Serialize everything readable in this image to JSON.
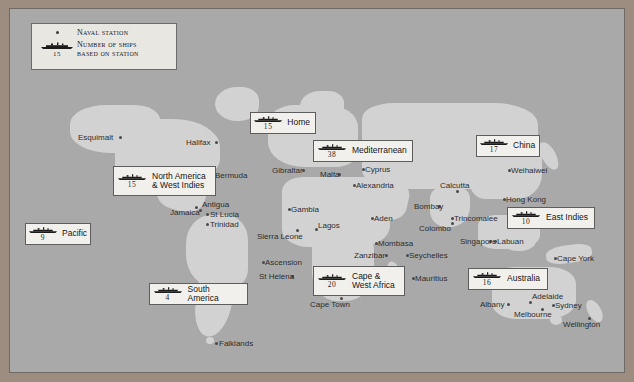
{
  "map": {
    "title": "Royal Navy Stations World Map",
    "colors": {
      "frame": "#9c8d80",
      "ocean": "#a9a9a9",
      "land": "#d2d2d2",
      "box_fill": "#f2f0ec",
      "box_border": "#5d5d5d",
      "label_text": "#2e2e2e",
      "marker": "#4a4a4a"
    }
  },
  "legend": {
    "naval_station_label": "Naval station",
    "ships_label": "Number of ships\nbased on station",
    "sample_count": "15",
    "naval_station_icon": "dot-marker-icon",
    "ship_icon": "battleship-silhouette-icon"
  },
  "stations": [
    {
      "name": "home",
      "label": "Home",
      "count": "15",
      "x": 240,
      "y": 103,
      "w": 66,
      "h": 22
    },
    {
      "name": "mediterranean",
      "label": "Mediterranean",
      "count": "38",
      "x": 303,
      "y": 131,
      "w": 100,
      "h": 22
    },
    {
      "name": "china",
      "label": "China",
      "count": "17",
      "x": 466,
      "y": 126,
      "w": 64,
      "h": 22
    },
    {
      "name": "north-america-west-indies",
      "label": "North America\n& West Indies",
      "count": "15",
      "x": 103,
      "y": 157,
      "w": 103,
      "h": 30
    },
    {
      "name": "east-indies",
      "label": "East Indies",
      "count": "10",
      "x": 497,
      "y": 198,
      "w": 88,
      "h": 22
    },
    {
      "name": "pacific",
      "label": "Pacific",
      "count": "9",
      "x": 15,
      "y": 214,
      "w": 66,
      "h": 22
    },
    {
      "name": "cape-west-africa",
      "label": "Cape &\nWest Africa",
      "count": "20",
      "x": 303,
      "y": 257,
      "w": 92,
      "h": 30
    },
    {
      "name": "australia",
      "label": "Australia",
      "count": "16",
      "x": 458,
      "y": 259,
      "w": 80,
      "h": 22
    },
    {
      "name": "south-america",
      "label": "South America",
      "count": "4",
      "x": 139,
      "y": 274,
      "w": 99,
      "h": 22
    }
  ],
  "places": [
    {
      "name": "esquimalt",
      "label": "Esquimalt",
      "lx": 68,
      "ly": 124,
      "dx": 109,
      "dy": 127
    },
    {
      "name": "halifax",
      "label": "Halifax",
      "lx": 176,
      "ly": 129,
      "dx": 205,
      "dy": 132
    },
    {
      "name": "bermuda",
      "label": "Bermuda",
      "lx": 205,
      "ly": 162,
      "dx": 201,
      "dy": 165
    },
    {
      "name": "antigua",
      "label": "Antigua",
      "lx": 192,
      "ly": 191,
      "dx": 189,
      "dy": 200
    },
    {
      "name": "jamaica",
      "label": "Jamaica",
      "lx": 160,
      "ly": 199,
      "dx": 185,
      "dy": 197
    },
    {
      "name": "st-lucia",
      "label": "St Lucia",
      "lx": 200,
      "ly": 201,
      "dx": 196,
      "dy": 204
    },
    {
      "name": "trinidad",
      "label": "Trinidad",
      "lx": 200,
      "ly": 211,
      "dx": 196,
      "dy": 214
    },
    {
      "name": "gibraltar",
      "label": "Gibraltar",
      "lx": 262,
      "ly": 157,
      "dx": 292,
      "dy": 160
    },
    {
      "name": "malta",
      "label": "Malta",
      "lx": 310,
      "ly": 161,
      "dx": 328,
      "dy": 164
    },
    {
      "name": "cyprus",
      "label": "Cyprus",
      "lx": 355,
      "ly": 156,
      "dx": 352,
      "dy": 159
    },
    {
      "name": "alexandria",
      "label": "Alexandria",
      "lx": 346,
      "ly": 172,
      "dx": 343,
      "dy": 175
    },
    {
      "name": "gambia",
      "label": "Gambia",
      "lx": 281,
      "ly": 196,
      "dx": 278,
      "dy": 199
    },
    {
      "name": "sierra-leone",
      "label": "Sierra Leone",
      "lx": 247,
      "ly": 223,
      "dx": 286,
      "dy": 220
    },
    {
      "name": "lagos",
      "label": "Lagos",
      "lx": 308,
      "ly": 212,
      "dx": 305,
      "dy": 219
    },
    {
      "name": "ascension",
      "label": "Ascension",
      "lx": 255,
      "ly": 249,
      "dx": 252,
      "dy": 252
    },
    {
      "name": "st-helena",
      "label": "St Helena",
      "lx": 249,
      "ly": 263,
      "dx": 281,
      "dy": 266
    },
    {
      "name": "cape-town",
      "label": "Cape Town",
      "lx": 300,
      "ly": 291,
      "dx": 330,
      "dy": 288
    },
    {
      "name": "falklands",
      "label": "Falklands",
      "lx": 209,
      "ly": 330,
      "dx": 205,
      "dy": 333
    },
    {
      "name": "zanzibar",
      "label": "Zanzibar",
      "lx": 344,
      "ly": 242,
      "dx": 375,
      "dy": 245
    },
    {
      "name": "mombasa",
      "label": "Mombasa",
      "lx": 368,
      "ly": 230,
      "dx": 365,
      "dy": 233
    },
    {
      "name": "seychelles",
      "label": "Seychelles",
      "lx": 399,
      "ly": 242,
      "dx": 396,
      "dy": 245
    },
    {
      "name": "mauritius",
      "label": "Mauritius",
      "lx": 405,
      "ly": 265,
      "dx": 402,
      "dy": 268
    },
    {
      "name": "aden",
      "label": "Aden",
      "lx": 364,
      "ly": 205,
      "dx": 361,
      "dy": 208
    },
    {
      "name": "bombay",
      "label": "Bombay",
      "lx": 404,
      "ly": 193,
      "dx": 428,
      "dy": 196
    },
    {
      "name": "calcutta",
      "label": "Calcutta",
      "lx": 430,
      "ly": 172,
      "dx": 446,
      "dy": 181
    },
    {
      "name": "colombo",
      "label": "Colombo",
      "lx": 409,
      "ly": 215,
      "dx": 441,
      "dy": 213
    },
    {
      "name": "trincomalee",
      "label": "Trincomalee",
      "lx": 444,
      "ly": 205,
      "dx": 441,
      "dy": 208
    },
    {
      "name": "singapore",
      "label": "Singapore",
      "lx": 450,
      "ly": 228,
      "dx": 479,
      "dy": 231
    },
    {
      "name": "labuan",
      "label": "Labuan",
      "lx": 487,
      "ly": 228,
      "dx": 484,
      "dy": 231
    },
    {
      "name": "hong-kong",
      "label": "Hong Kong",
      "lx": 496,
      "ly": 186,
      "dx": 493,
      "dy": 189
    },
    {
      "name": "weihaiwei",
      "label": "Weihaiwei",
      "lx": 501,
      "ly": 157,
      "dx": 498,
      "dy": 160
    },
    {
      "name": "cape-york",
      "label": "Cape York",
      "lx": 547,
      "ly": 245,
      "dx": 544,
      "dy": 248
    },
    {
      "name": "albany",
      "label": "Albany",
      "lx": 470,
      "ly": 291,
      "dx": 497,
      "dy": 294
    },
    {
      "name": "adelaide",
      "label": "Adelaide",
      "lx": 522,
      "ly": 283,
      "dx": 519,
      "dy": 292
    },
    {
      "name": "melbourne",
      "label": "Melbourne",
      "lx": 504,
      "ly": 301,
      "dx": 531,
      "dy": 299
    },
    {
      "name": "sydney",
      "label": "Sydney",
      "lx": 545,
      "ly": 292,
      "dx": 542,
      "dy": 295
    },
    {
      "name": "wellington",
      "label": "Wellington",
      "lx": 553,
      "ly": 311,
      "dx": 578,
      "dy": 308
    }
  ]
}
